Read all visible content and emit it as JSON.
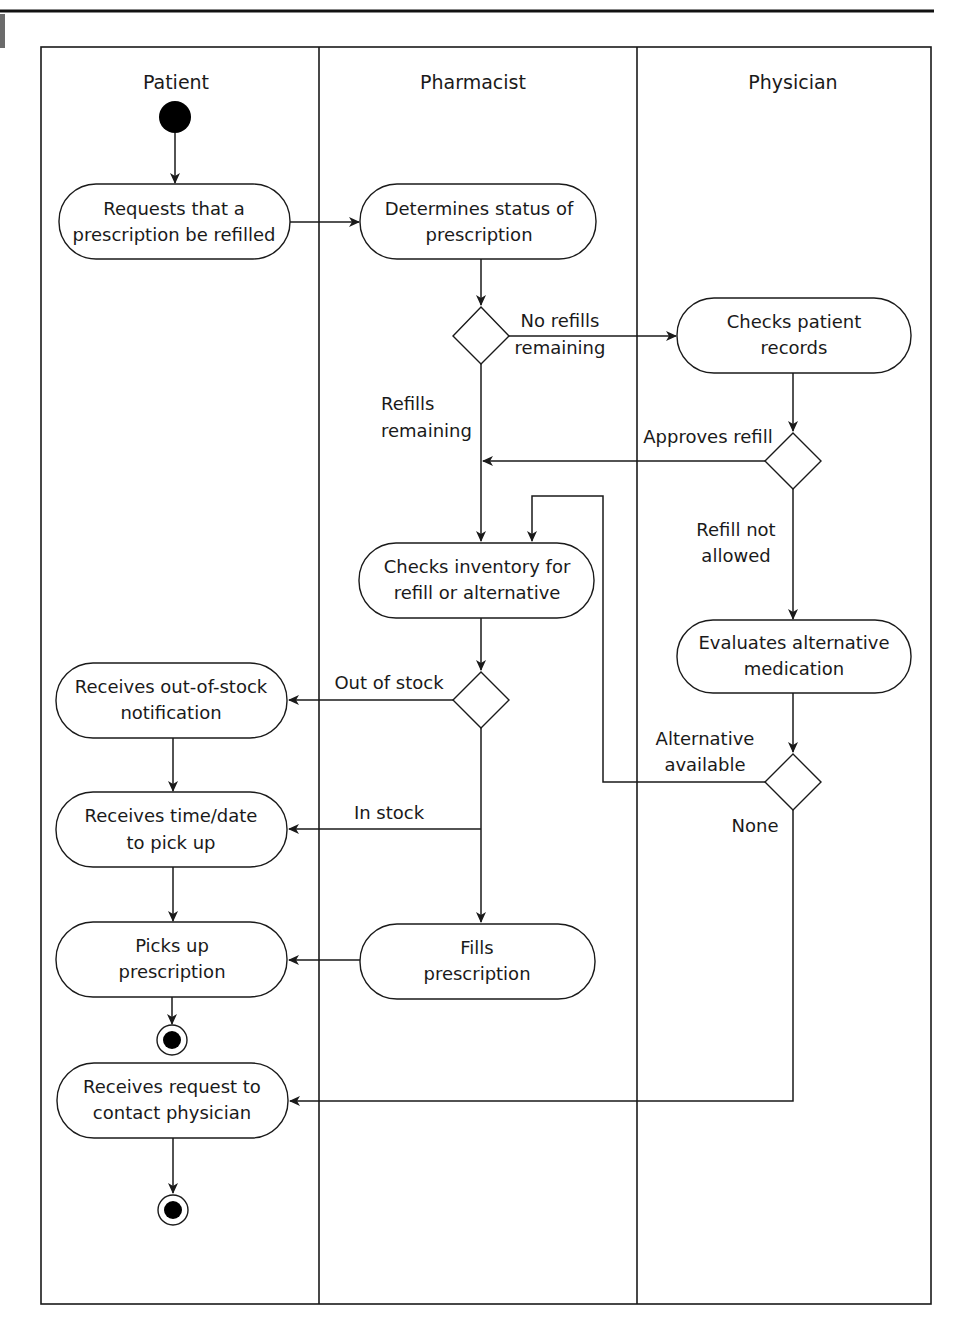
{
  "diagram": {
    "type": "uml-activity-swimlane",
    "lanes": [
      {
        "id": "patient",
        "label": "Patient"
      },
      {
        "id": "pharmacist",
        "label": "Pharmacist"
      },
      {
        "id": "physician",
        "label": "Physician"
      }
    ],
    "activities": {
      "request_refill": {
        "line1": "Requests that a",
        "line2": "prescription be refilled"
      },
      "determine_status": {
        "line1": "Determines status of",
        "line2": "prescription"
      },
      "check_records": {
        "line1": "Checks patient",
        "line2": "records"
      },
      "check_inventory": {
        "line1": "Checks inventory for",
        "line2": "refill or alternative"
      },
      "evaluate_alt": {
        "line1": "Evaluates alternative",
        "line2": "medication"
      },
      "out_of_stock_notice": {
        "line1": "Receives out-of-stock",
        "line2": "notification"
      },
      "receive_time": {
        "line1": "Receives time/date",
        "line2": "to pick up"
      },
      "pick_up": {
        "line1": "Picks up",
        "line2": "prescription"
      },
      "fill": {
        "line1": "Fills",
        "line2": "prescription"
      },
      "contact_physician": {
        "line1": "Receives request to",
        "line2": "contact physician"
      }
    },
    "guards": {
      "no_refills": {
        "line1": "No refills",
        "line2": "remaining"
      },
      "refills_remaining": {
        "line1": "Refills",
        "line2": "remaining"
      },
      "approves_refill": "Approves refill",
      "refill_not_allowed": {
        "line1": "Refill not",
        "line2": "allowed"
      },
      "out_of_stock": "Out of stock",
      "in_stock": "In stock",
      "alternative_available": {
        "line1": "Alternative",
        "line2": "available"
      },
      "none": "None"
    }
  }
}
